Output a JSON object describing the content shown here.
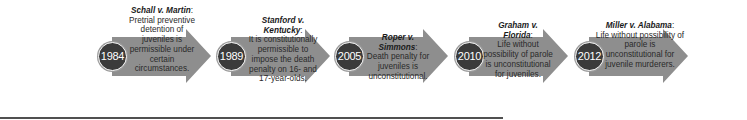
{
  "timeline": {
    "colors": {
      "arrow_fill": "#8e8e8e",
      "year_badge": "#3b3b3b",
      "text": "#2a2a2a",
      "rule": "#505050"
    },
    "events": [
      {
        "year": "1984",
        "case_name": "Schall v. Martin",
        "holding": "Pretrial preventive detention of juveniles is permissible under certain circumstances."
      },
      {
        "year": "1989",
        "case_name": "Stanford v. Kentucky",
        "holding": "It is constitutionally permissible to impose the death penalty on 16- and 17-year-olds."
      },
      {
        "year": "2005",
        "case_name": "Roper v. Simmons",
        "holding": "Death penalty for juveniles is unconstitutional."
      },
      {
        "year": "2010",
        "case_name": "Graham v. Florida",
        "holding": "Life without possibility of parole is unconstitutional for juveniles."
      },
      {
        "year": "2012",
        "case_name": "Miller v. Alabama",
        "holding": "Life without possibility of parole is unconstitutional for juvenile murderers."
      }
    ]
  }
}
